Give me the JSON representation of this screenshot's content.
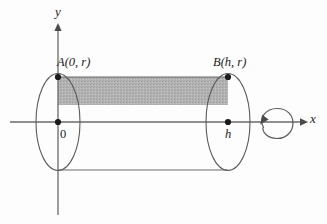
{
  "figure": {
    "background_color": "#fdfdfd",
    "line_color": "#5a5a5a",
    "axis_color": "#6a6a6a",
    "text_color": "#1b1b1b",
    "shade_color": "#b3b3b3",
    "labels": {
      "x_axis": "x",
      "y_axis": "y",
      "origin": "0",
      "point_a": "A(0, r)",
      "point_b": "B(h, r)",
      "height_mark": "h"
    },
    "icons": {
      "x_arrow": "arrow-right-icon",
      "y_arrow": "arrow-up-icon",
      "revolution": "rotation-loop-icon"
    },
    "geometry": {
      "origin": {
        "x": 58,
        "y": 122
      },
      "x_axis": {
        "x1": 10,
        "y1": 122,
        "x2": 305,
        "y2": 122
      },
      "y_axis": {
        "x1": 58,
        "y1": 24,
        "x2": 58,
        "y2": 215
      },
      "left_ellipse": {
        "cx": 58,
        "cy": 122,
        "rx": 22,
        "ry": 49
      },
      "right_ellipse": {
        "cx": 228,
        "cy": 122,
        "rx": 22,
        "ry": 49
      },
      "shaded_rect": {
        "x": 58,
        "y": 77,
        "width": 170,
        "height": 28
      },
      "top_edge_y": 77,
      "bottom_edge_y": 170,
      "radius_r": 45,
      "height_h": 170,
      "rotation_loop": {
        "cx": 277,
        "cy": 123,
        "r": 14
      }
    },
    "points": [
      {
        "name": "A",
        "cx": 58,
        "cy": 77,
        "label": "A(0, r)"
      },
      {
        "name": "O",
        "cx": 58,
        "cy": 122,
        "label": "0"
      },
      {
        "name": "B",
        "cx": 228,
        "cy": 77,
        "label": "B(h, r)"
      },
      {
        "name": "h",
        "cx": 228,
        "cy": 122,
        "label": "h"
      }
    ]
  }
}
